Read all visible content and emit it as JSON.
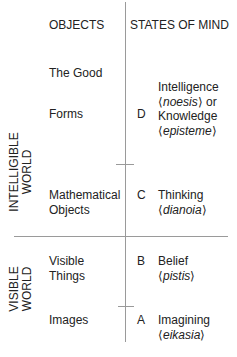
{
  "headers": {
    "objects": "OBJECTS",
    "states": "STATES OF MIND"
  },
  "worlds": {
    "intelligible": {
      "line1": "INTELLIGIBLE",
      "line2": "WORLD"
    },
    "visible": {
      "line1": "VISIBLE",
      "line2": "WORLD"
    }
  },
  "objects": {
    "the_good": "The Good",
    "forms": "Forms",
    "mathematical_1": "Mathematical",
    "mathematical_2": "Objects",
    "visible_1": "Visible",
    "visible_2": "Things",
    "images": "Images"
  },
  "states": [
    {
      "letter": "D",
      "lines": [
        "Intelligence",
        "noesis",
        "or",
        "Knowledge",
        "episteme"
      ]
    },
    {
      "letter": "C",
      "lines": [
        "Thinking",
        "dianoia"
      ]
    },
    {
      "letter": "B",
      "lines": [
        "Belief",
        "pistis"
      ]
    },
    {
      "letter": "A",
      "lines": [
        "Imagining",
        "eikasia"
      ]
    }
  ]
}
